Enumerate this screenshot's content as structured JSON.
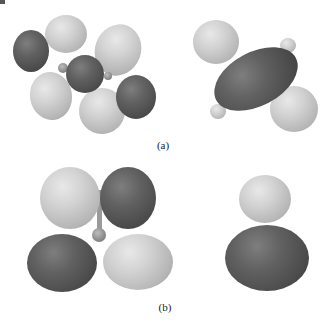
{
  "figure": {
    "panels": [
      {
        "id": "a",
        "label": "(a)",
        "structures": [
          {
            "name": "molecular-orbital-a-left",
            "description": "multi-lobe orbital isosurface (alternating phases)"
          },
          {
            "name": "molecular-orbital-a-right",
            "description": "elongated central lobe with two opposite-phase spherical lobes"
          }
        ]
      },
      {
        "id": "b",
        "label": "(b)",
        "structures": [
          {
            "name": "molecular-orbital-b-left",
            "description": "four-lobe d-type orbital isosurface"
          },
          {
            "name": "molecular-orbital-b-right",
            "description": "two-lobe p-type orbital isosurface"
          }
        ]
      }
    ],
    "colors": {
      "positive_phase": "#d2d2d2",
      "negative_phase": "#555555",
      "background": "#ffffff"
    }
  }
}
